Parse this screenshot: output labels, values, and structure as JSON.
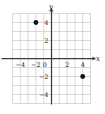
{
  "chart_data": {
    "type": "scatter",
    "title": "",
    "xlabel": "x",
    "ylabel": "y",
    "xlim": [
      -5,
      5
    ],
    "ylim": [
      -5,
      5
    ],
    "grid": true,
    "grid_step": 1,
    "legend": "none",
    "x_ticks": [
      -4,
      -2,
      0,
      2,
      4
    ],
    "y_ticks": [
      4,
      2,
      0,
      -2,
      -4
    ],
    "x_tick_labels": [
      "−4",
      "−2",
      "0",
      "2",
      "4"
    ],
    "y_tick_labels": [
      "4",
      "2",
      "0",
      "−2",
      "−4"
    ],
    "points": [
      {
        "label": "point-a",
        "x": -2,
        "y": 4
      },
      {
        "label": "point-b",
        "x": 4,
        "y": -2
      }
    ],
    "point_color": "#111111",
    "point_radius": 2.4,
    "axis_color": "#3c3c3c",
    "grid_color": "#c9c9c9",
    "background": "#ffffff"
  },
  "axes": {
    "x_axis_label": "x",
    "y_axis_label": "y"
  }
}
